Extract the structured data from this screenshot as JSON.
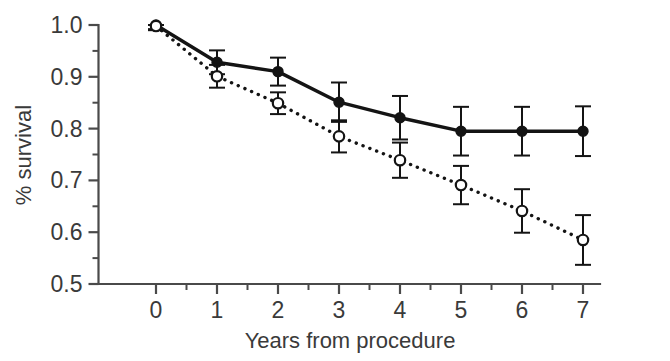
{
  "chart_data": {
    "type": "line",
    "title": "",
    "subtitle": "",
    "xlabel": "Years from procedure",
    "ylabel": "% survival",
    "x": [
      0,
      1,
      2,
      3,
      4,
      5,
      6,
      7
    ],
    "xtick_labels": [
      "0",
      "1",
      "2",
      "3",
      "4",
      "5",
      "6",
      "7"
    ],
    "ytick_labels": [
      "0.5",
      "0.6",
      "0.7",
      "0.8",
      "0.9",
      "1.0"
    ],
    "ytick_values": [
      0.5,
      0.6,
      0.7,
      0.8,
      0.9,
      1.0
    ],
    "yminor_values": [
      0.55,
      0.65,
      0.75,
      0.85,
      0.95
    ],
    "xlim": [
      -0.28,
      7.28
    ],
    "ylim": [
      0.5,
      1.0
    ],
    "grid": false,
    "legend": "none",
    "error_bars": "symmetric",
    "series": [
      {
        "name": "solid-series",
        "line_style": "solid",
        "marker": "filled-circle",
        "color": "#141414",
        "values": [
          1.0,
          0.928,
          0.91,
          0.851,
          0.821,
          0.795,
          0.795,
          0.795
        ],
        "errors": [
          0.008,
          0.023,
          0.027,
          0.038,
          0.042,
          0.047,
          0.047,
          0.048
        ]
      },
      {
        "name": "dotted-series",
        "line_style": "dotted",
        "marker": "open-circle",
        "color": "#141414",
        "values": [
          0.998,
          0.901,
          0.849,
          0.785,
          0.739,
          0.691,
          0.641,
          0.585
        ],
        "errors": [
          0.008,
          0.022,
          0.021,
          0.031,
          0.034,
          0.037,
          0.042,
          0.048
        ]
      }
    ]
  },
  "figure": {
    "background_color": "#ffffff",
    "axis_color": "#4a4a4a",
    "data_color": "#141414"
  }
}
